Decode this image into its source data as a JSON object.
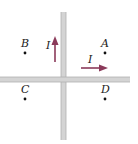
{
  "diagram": {
    "wires": [
      {
        "orientation": "vertical",
        "current_label": "I",
        "direction": "up"
      },
      {
        "orientation": "horizontal",
        "current_label": "I",
        "direction": "right"
      }
    ],
    "points": [
      {
        "label": "A",
        "quadrant": "upper-right"
      },
      {
        "label": "B",
        "quadrant": "upper-left"
      },
      {
        "label": "C",
        "quadrant": "lower-left"
      },
      {
        "label": "D",
        "quadrant": "lower-right"
      }
    ],
    "colors": {
      "wire": "#c8c8c8",
      "wire_edge": "#a9a9a9",
      "arrow": "#8b3a5a",
      "dot": "#111111",
      "text": "#222222"
    }
  }
}
